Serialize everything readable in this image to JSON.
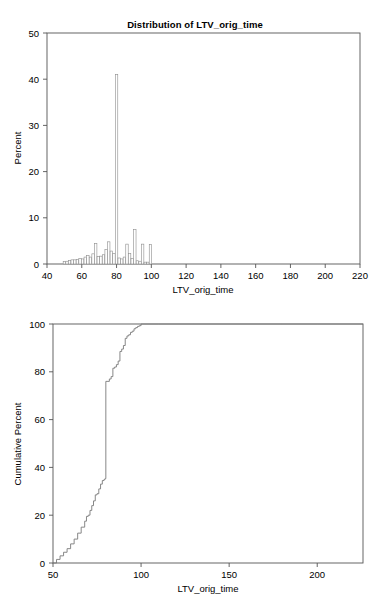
{
  "page": {
    "background_color": "#ffffff",
    "width": 390,
    "height": 597
  },
  "panels": {
    "histogram": {
      "title": "Distribution of LTV_orig_time",
      "xlabel": "LTV_orig_time",
      "ylabel": "Percent"
    },
    "cdf": {
      "title": "Cumulative Distribution Function for LTV_orig_time",
      "xlabel": "LTV_orig_time",
      "ylabel": "Cumulative Percent"
    }
  },
  "chart_data": [
    {
      "type": "bar",
      "id": "histogram",
      "title": "Distribution of LTV_orig_time",
      "xlabel": "LTV_orig_time",
      "ylabel": "Percent",
      "xlim": [
        40,
        220
      ],
      "ylim": [
        0,
        50
      ],
      "xticks": [
        40,
        60,
        80,
        100,
        120,
        140,
        160,
        180,
        200,
        220
      ],
      "yticks": [
        0,
        10,
        20,
        30,
        40,
        50
      ],
      "grid": false,
      "legend": "none",
      "bar_width": 1.4,
      "bin_centers": [
        50,
        51.5,
        53,
        54.5,
        56,
        57.5,
        59,
        60.5,
        62,
        63.5,
        65,
        66.5,
        68,
        69.5,
        71,
        72.5,
        74,
        75.5,
        77,
        78.5,
        80,
        81.5,
        83,
        84.5,
        86,
        87.5,
        89,
        90.5,
        92,
        93.5,
        95,
        96.5,
        98,
        99.5
      ],
      "values": [
        0.5,
        0.6,
        0.8,
        0.9,
        0.9,
        1.0,
        1.2,
        1.1,
        1.5,
        1.8,
        1.5,
        2.2,
        4.4,
        1.6,
        1.7,
        2.0,
        3.1,
        4.8,
        2.8,
        2.3,
        41.0,
        1.3,
        1.1,
        1.5,
        4.3,
        2.3,
        1.2,
        7.5,
        0.7,
        0.6,
        4.3,
        0.4,
        0.4,
        4.2
      ],
      "peak": {
        "x": 80,
        "y": 41.0,
        "note": "dominant spike at LTV = 80"
      }
    },
    {
      "type": "line",
      "id": "cdf",
      "title": "Cumulative Distribution Function for LTV_orig_time",
      "xlabel": "LTV_orig_time",
      "ylabel": "Cumulative Percent",
      "xlim": [
        50,
        226
      ],
      "ylim": [
        0,
        100
      ],
      "xticks": [
        50,
        100,
        150,
        200
      ],
      "yticks": [
        0,
        20,
        40,
        60,
        80,
        100
      ],
      "grid": false,
      "legend": "none",
      "step": true,
      "x": [
        50,
        52,
        54,
        56,
        58,
        60,
        62,
        64,
        66,
        68,
        69,
        70,
        71,
        72,
        73,
        74,
        75,
        76,
        77,
        78,
        79,
        79.6,
        80,
        82,
        83,
        84,
        85,
        86,
        87,
        88,
        89,
        90,
        91,
        92,
        93,
        94,
        95,
        96,
        97,
        98,
        99,
        100,
        110,
        130,
        150,
        180,
        200,
        226
      ],
      "y": [
        0,
        1.5,
        3.0,
        4.5,
        6.0,
        8.0,
        10.0,
        12.5,
        15.0,
        17.5,
        19.5,
        20.0,
        22.0,
        24.0,
        26.0,
        28.5,
        29.0,
        31.0,
        33.0,
        34.5,
        35.0,
        35.3,
        76.0,
        77.0,
        78.0,
        81.5,
        82.0,
        83.0,
        84.5,
        88.5,
        89.5,
        91.0,
        94.0,
        95.0,
        95.5,
        96.5,
        97.0,
        98.0,
        98.5,
        99.0,
        99.3,
        100.0,
        100.0,
        100.0,
        100.0,
        100.0,
        100.0,
        100.0
      ]
    }
  ]
}
